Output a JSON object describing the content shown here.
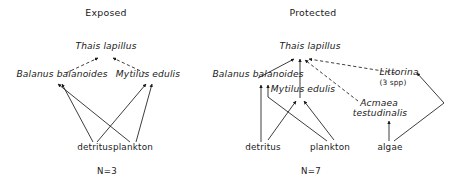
{
  "figure": {
    "type": "food-web-diagram",
    "stroke_color": "#1a1a1a",
    "background": "#ffffff"
  },
  "panels": [
    {
      "id": "exposed",
      "title": "Exposed",
      "sample_label": "N=3",
      "nodes": [
        {
          "id": "thais",
          "label": "Thais lapillus",
          "style": "scientific",
          "trophic": "predator"
        },
        {
          "id": "balanus",
          "label": "Balanus balanoides",
          "style": "scientific",
          "trophic": "consumer"
        },
        {
          "id": "mytilus",
          "label": "Mytilus edulis",
          "style": "scientific",
          "trophic": "consumer"
        },
        {
          "id": "detritus",
          "label": "detritus",
          "style": "common",
          "trophic": "resource"
        },
        {
          "id": "plankton",
          "label": "plankton",
          "style": "common",
          "trophic": "resource"
        }
      ],
      "links": [
        {
          "from": "balanus",
          "to": "thais",
          "line": "dashed"
        },
        {
          "from": "mytilus",
          "to": "thais",
          "line": "dashed"
        },
        {
          "from": "detritus",
          "to": "balanus",
          "line": "solid"
        },
        {
          "from": "detritus",
          "to": "mytilus",
          "line": "solid"
        },
        {
          "from": "plankton",
          "to": "balanus",
          "line": "solid"
        },
        {
          "from": "plankton",
          "to": "mytilus",
          "line": "solid"
        }
      ]
    },
    {
      "id": "protected",
      "title": "Protected",
      "sample_label": "N=7",
      "nodes": [
        {
          "id": "thais",
          "label": "Thais lapillus",
          "style": "scientific",
          "trophic": "predator"
        },
        {
          "id": "balanus",
          "label": "Balanus balanoides",
          "style": "scientific",
          "trophic": "consumer"
        },
        {
          "id": "mytilus",
          "label": "Mytilus edulis",
          "style": "scientific",
          "trophic": "consumer"
        },
        {
          "id": "littorina",
          "label": "Littorina",
          "style": "scientific",
          "trophic": "consumer",
          "annotation": "(3 spp)"
        },
        {
          "id": "acmaea",
          "label": "Acmaea",
          "style": "scientific",
          "trophic": "consumer",
          "label_line2": "testudinalis"
        },
        {
          "id": "detritus",
          "label": "detritus",
          "style": "common",
          "trophic": "resource"
        },
        {
          "id": "plankton",
          "label": "plankton",
          "style": "common",
          "trophic": "resource"
        },
        {
          "id": "algae",
          "label": "algae",
          "style": "common",
          "trophic": "resource"
        }
      ],
      "links": [
        {
          "from": "balanus",
          "to": "thais",
          "line": "solid"
        },
        {
          "from": "mytilus",
          "to": "thais",
          "line": "solid"
        },
        {
          "from": "acmaea",
          "to": "thais",
          "line": "dashed"
        },
        {
          "from": "littorina",
          "to": "thais",
          "line": "dashed"
        },
        {
          "from": "detritus",
          "to": "balanus",
          "line": "solid"
        },
        {
          "from": "plankton",
          "to": "balanus",
          "line": "solid"
        },
        {
          "from": "detritus",
          "to": "mytilus",
          "line": "solid"
        },
        {
          "from": "plankton",
          "to": "mytilus",
          "line": "solid"
        },
        {
          "from": "algae",
          "to": "acmaea",
          "line": "solid"
        },
        {
          "from": "algae",
          "to": "littorina",
          "line": "solid"
        }
      ]
    }
  ],
  "labels": {
    "exposed_title": "Exposed",
    "protected_title": "Protected",
    "exposed_n": "N=3",
    "protected_n": "N=7",
    "thais_left": "Thais lapillus",
    "balanus_left": "Balanus balanoides",
    "mytilus_left": "Mytilus edulis",
    "detritus_left": "detritus",
    "plankton_left": "plankton",
    "thais_right": "Thais lapillus",
    "balanus_right": "Balanus balanoides",
    "mytilus_right": "Mytilus edulis",
    "littorina": "Littorina",
    "littorina_spp": "(3 spp)",
    "acmaea_1": "Acmaea",
    "acmaea_2": "testudinalis",
    "detritus_right": "detritus",
    "plankton_right": "plankton",
    "algae_right": "algae"
  }
}
